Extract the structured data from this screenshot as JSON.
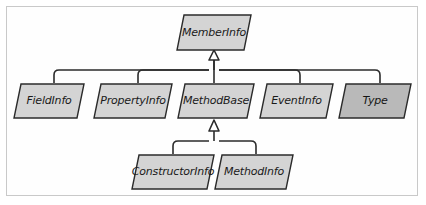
{
  "diagram": {
    "type": "uml-class-hierarchy",
    "relationship_label": "generalization (inheritance)",
    "background_color": "#fefefe",
    "frame_color": "#c9c9c9",
    "line_color": "#2b2b2b",
    "node_fill_light": "#d4d4d4",
    "node_fill_dark": "#b9b9b9",
    "node_stroke": "#2b2b2b",
    "text_color": "#1a1a1a",
    "levels": [
      {
        "level": 0,
        "nodes": [
          {
            "id": "memberinfo",
            "label": "MemberInfo",
            "fill": "light",
            "x": 176,
            "y": 14,
            "width": 76,
            "height": 37,
            "skew": 11
          }
        ]
      },
      {
        "level": 1,
        "nodes": [
          {
            "id": "fieldinfo",
            "label": "FieldInfo",
            "fill": "light",
            "x": 13,
            "y": 83,
            "width": 72,
            "height": 36,
            "skew": 11
          },
          {
            "id": "propertyinfo",
            "label": "PropertyInfo",
            "fill": "light",
            "x": 93,
            "y": 83,
            "width": 80,
            "height": 36,
            "skew": 11
          },
          {
            "id": "methodbase",
            "label": "MethodBase",
            "fill": "light",
            "x": 177,
            "y": 83,
            "width": 78,
            "height": 36,
            "skew": 11
          },
          {
            "id": "eventinfo",
            "label": "EventInfo",
            "fill": "light",
            "x": 259,
            "y": 83,
            "width": 75,
            "height": 36,
            "skew": 11
          },
          {
            "id": "type",
            "label": "Type",
            "fill": "dark",
            "x": 338,
            "y": 83,
            "width": 74,
            "height": 36,
            "skew": 11
          }
        ]
      },
      {
        "level": 2,
        "nodes": [
          {
            "id": "constructorinfo",
            "label": "ConstructorInfo",
            "fill": "light",
            "x": 131,
            "y": 154,
            "width": 84,
            "height": 36,
            "skew": 11
          },
          {
            "id": "methodinfo",
            "label": "MethodInfo",
            "fill": "light",
            "x": 214,
            "y": 154,
            "width": 80,
            "height": 36,
            "skew": 11
          }
        ]
      }
    ],
    "edges": [
      {
        "from": "fieldinfo",
        "to": "memberinfo"
      },
      {
        "from": "propertyinfo",
        "to": "memberinfo"
      },
      {
        "from": "methodbase",
        "to": "memberinfo"
      },
      {
        "from": "eventinfo",
        "to": "memberinfo"
      },
      {
        "from": "type",
        "to": "memberinfo"
      },
      {
        "from": "constructorinfo",
        "to": "methodbase"
      },
      {
        "from": "methodinfo",
        "to": "methodbase"
      }
    ]
  }
}
